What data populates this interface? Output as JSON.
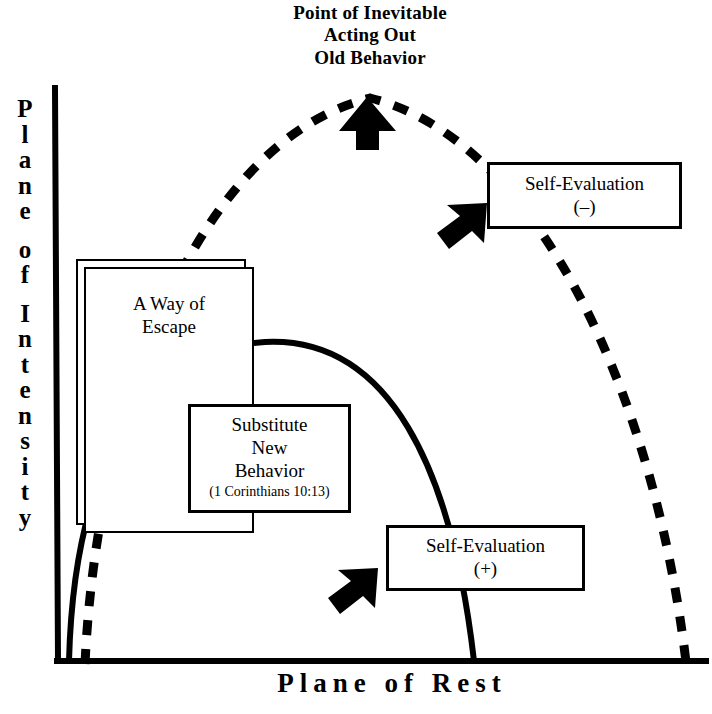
{
  "diagram": {
    "title_caption": {
      "line1": "Point of Inevitable",
      "line2": "Acting Out",
      "line3": "Old Behavior"
    },
    "axes": {
      "y_label": "Plane of Intensity",
      "y_label_chars": [
        "P",
        "l",
        "a",
        "n",
        "e",
        "",
        "o",
        "f",
        "",
        "I",
        "n",
        "t",
        "e",
        "n",
        "s",
        "i",
        "t",
        "y"
      ],
      "x_label": "Plane of Rest",
      "axis_color": "#000000"
    },
    "curves": {
      "old_behavior_curve": {
        "name": "dashed-escalation-curve",
        "style": "dashed",
        "color": "#000000",
        "width": 9,
        "dash": "15 14",
        "start": [
          85,
          664
        ],
        "apex": [
          370,
          98
        ],
        "end": [
          686,
          662
        ]
      },
      "new_behavior_curve": {
        "name": "solid-substitute-curve",
        "style": "solid",
        "color": "#000000",
        "width": 6,
        "start": [
          69,
          661
        ],
        "apex": [
          265,
          342
        ],
        "end": [
          474,
          661
        ]
      }
    },
    "boxes": [
      {
        "name": "way-of-escape",
        "lines": [
          "A Way of",
          "Escape"
        ],
        "double_border": true
      },
      {
        "name": "substitute-new-behavior",
        "lines": [
          "Substitute",
          "New",
          "Behavior"
        ],
        "reference": "(1 Corinthians 10:13)",
        "double_border": false
      },
      {
        "name": "self-evaluation-negative",
        "lines": [
          "Self-Evaluation",
          "(–)"
        ],
        "double_border": false
      },
      {
        "name": "self-evaluation-positive",
        "lines": [
          "Self-Evaluation",
          "(+)"
        ],
        "double_border": false
      }
    ],
    "arrows": [
      {
        "name": "apex-up-arrow",
        "direction": "up",
        "color": "#000000"
      },
      {
        "name": "upper-right-arrow",
        "direction": "up-right",
        "color": "#000000"
      },
      {
        "name": "lower-right-arrow",
        "direction": "up-right",
        "color": "#000000"
      }
    ],
    "background_color": "#ffffff",
    "ink_color": "#000000"
  }
}
